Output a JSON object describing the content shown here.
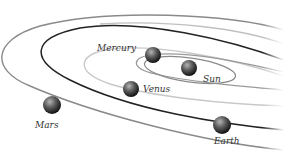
{
  "diagram": {
    "title": "",
    "colors": {
      "background": "#ffffff",
      "orbit_dark": "#222222",
      "orbit_mid": "#8a8a8a",
      "orbit_light": "#c8c8c8",
      "planet_highlight": "#9a9a9a",
      "planet_shadow": "#111111",
      "label_text": "#333333"
    },
    "bodies": [
      {
        "id": "mercury",
        "label": "Mercury",
        "cx": 153,
        "cy": 55,
        "r": 8
      },
      {
        "id": "sun",
        "label": "Sun",
        "cx": 189,
        "cy": 68,
        "r": 8
      },
      {
        "id": "venus",
        "label": "Venus",
        "cx": 131,
        "cy": 89,
        "r": 8
      },
      {
        "id": "mars",
        "label": "Mars",
        "cx": 52,
        "cy": 105,
        "r": 9
      },
      {
        "id": "earth",
        "label": "Earth",
        "cx": 222,
        "cy": 125,
        "r": 9
      }
    ],
    "labels": {
      "mercury": "Mercury",
      "sun": "Sun",
      "venus": "Venus",
      "mars": "Mars",
      "earth": "Earth"
    }
  }
}
